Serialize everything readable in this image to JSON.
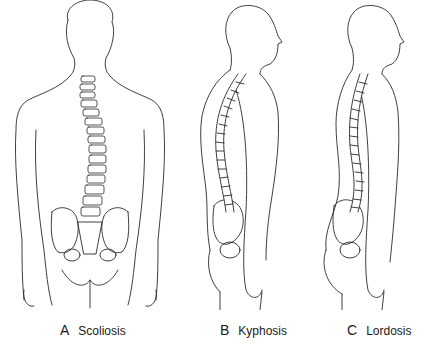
{
  "figure": {
    "panels": [
      {
        "letter": "A",
        "label": "Scoliosis",
        "view": "posterior"
      },
      {
        "letter": "B",
        "label": "Kyphosis",
        "view": "lateral"
      },
      {
        "letter": "C",
        "label": "Lordosis",
        "view": "lateral"
      }
    ]
  }
}
